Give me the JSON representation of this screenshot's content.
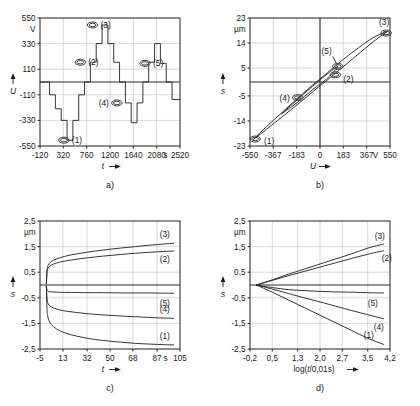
{
  "figure": {
    "panels": [
      {
        "id": "a",
        "label": "a)",
        "yaxis": {
          "unit": "V",
          "title": "U",
          "ticks": [
            "550",
            "330",
            "110",
            "-110",
            "-330",
            "-550"
          ],
          "values": [
            550,
            330,
            110,
            -110,
            -330,
            -550
          ],
          "min": -550,
          "max": 550
        },
        "xaxis": {
          "unit": "s",
          "title": "t",
          "ticks": [
            "-120",
            "320",
            "760",
            "1200",
            "1640",
            "2080",
            "2520"
          ],
          "values": [
            -120,
            320,
            760,
            1200,
            1640,
            2080,
            2520
          ],
          "min": -120,
          "max": 2520
        },
        "markers": [
          {
            "label": "(1)",
            "x": 330,
            "y": -500
          },
          {
            "label": "(2)",
            "x": 640,
            "y": 170
          },
          {
            "label": "(3)",
            "x": 870,
            "y": 490
          },
          {
            "label": "(4)",
            "x": 1330,
            "y": -180
          },
          {
            "label": "(5)",
            "x": 1860,
            "y": 160
          }
        ]
      },
      {
        "id": "b",
        "label": "b)",
        "yaxis": {
          "unit": "µm",
          "title": "s",
          "ticks": [
            "23",
            "14",
            "5",
            "-5",
            "-14",
            "-23"
          ],
          "values": [
            23,
            14,
            5,
            -5,
            -14,
            -23
          ],
          "min": -23,
          "max": 23
        },
        "xaxis": {
          "unit": "V",
          "title": "U",
          "ticks": [
            "-550",
            "-367",
            "-183",
            "0",
            "183",
            "367",
            "550"
          ],
          "values": [
            -550,
            -367,
            -183,
            0,
            183,
            367,
            550
          ],
          "min": -550,
          "max": 550
        },
        "markers": [
          {
            "label": "(1)",
            "x": -510,
            "y": -20.5
          },
          {
            "label": "(2)",
            "x": 120,
            "y": 2.6
          },
          {
            "label": "(3)",
            "x": 520,
            "y": 17.6
          },
          {
            "label": "(4)",
            "x": -175,
            "y": -5.6
          },
          {
            "label": "(5)",
            "x": 140,
            "y": 5.6
          }
        ]
      },
      {
        "id": "c",
        "label": "c)",
        "yaxis": {
          "unit": "µm",
          "title": "s",
          "ticks": [
            "2,5",
            "1,5",
            "0,5",
            "-0,5",
            "-1,5",
            "-2,5"
          ],
          "values": [
            2.5,
            1.5,
            0.5,
            -0.5,
            -1.5,
            -2.5
          ],
          "min": -2.5,
          "max": 2.5
        },
        "xaxis": {
          "unit": "s",
          "title": "t",
          "ticks": [
            "-5",
            "13",
            "32",
            "50",
            "68",
            "87",
            "105"
          ],
          "values": [
            -5,
            13,
            32,
            50,
            68,
            87,
            105
          ],
          "min": -5,
          "max": 105
        },
        "curve_labels": [
          "(3)",
          "(2)",
          "(5)",
          "(4)",
          "(1)"
        ]
      },
      {
        "id": "d",
        "label": "d)",
        "yaxis": {
          "unit": "µm",
          "title": "s",
          "ticks": [
            "2,5",
            "1,5",
            "0,5",
            "-0,5",
            "-1,5",
            "-2,5"
          ],
          "values": [
            2.5,
            1.5,
            0.5,
            -0.5,
            -1.5,
            -2.5
          ],
          "min": -2.5,
          "max": 2.5
        },
        "xaxis": {
          "unit": "",
          "title": "log(t/0,01s)",
          "ticks": [
            "-0,2",
            "0,5",
            "1,3",
            "2,0",
            "2,7",
            "3,5",
            "4,2"
          ],
          "values": [
            -0.2,
            0.5,
            1.3,
            2.0,
            2.7,
            3.5,
            4.2
          ],
          "min": -0.2,
          "max": 4.2
        },
        "curve_labels": [
          "(3)",
          "(2)",
          "(5)",
          "(4)",
          "(1)"
        ]
      }
    ]
  },
  "chart_data": [
    {
      "type": "line",
      "panel": "a",
      "title": "",
      "xlabel": "t",
      "ylabel": "U",
      "xunit": "s",
      "yunit": "V",
      "xlim": [
        -120,
        2520
      ],
      "ylim": [
        -550,
        550
      ],
      "grid": true,
      "series": [
        {
          "name": "drive voltage staircase",
          "step": true,
          "x": [
            -120,
            60,
            60,
            170,
            170,
            280,
            280,
            390,
            390,
            500,
            500,
            610,
            610,
            720,
            720,
            830,
            830,
            940,
            940,
            1050,
            1050,
            1160,
            1160,
            1270,
            1270,
            1380,
            1380,
            1490,
            1490,
            1600,
            1600,
            1710,
            1710,
            1820,
            1820,
            1930,
            1930,
            2040,
            2040,
            2150,
            2150,
            2260,
            2260,
            2370,
            2370,
            2520
          ],
          "y": [
            0,
            0,
            -110,
            -110,
            -230,
            -230,
            -330,
            -330,
            -500,
            -500,
            -330,
            -330,
            -110,
            -110,
            0,
            0,
            170,
            170,
            330,
            330,
            490,
            490,
            330,
            330,
            170,
            170,
            0,
            0,
            -180,
            -180,
            -350,
            -350,
            -180,
            -180,
            0,
            0,
            170,
            170,
            330,
            330,
            160,
            160,
            0,
            0,
            -150,
            -150
          ]
        }
      ]
    },
    {
      "type": "line",
      "panel": "b",
      "title": "",
      "xlabel": "U",
      "ylabel": "s",
      "xunit": "V",
      "yunit": "µm",
      "xlim": [
        -550,
        550
      ],
      "ylim": [
        -23,
        23
      ],
      "grid": true,
      "series": [
        {
          "name": "hysteresis loop outer",
          "closed": true,
          "x": [
            -520,
            -420,
            -300,
            -180,
            -60,
            60,
            180,
            300,
            420,
            520,
            520,
            420,
            300,
            180,
            60,
            -60,
            -180,
            -300,
            -420,
            -520
          ],
          "y": [
            -20.5,
            -16.0,
            -11.0,
            -6.0,
            -1.2,
            3.4,
            8.0,
            12.2,
            16.0,
            17.9,
            17.9,
            14.5,
            10.0,
            5.4,
            0.8,
            -3.6,
            -8.2,
            -12.6,
            -17.0,
            -20.5
          ]
        },
        {
          "name": "hysteresis loop inner",
          "closed": true,
          "x": [
            -300,
            -180,
            -60,
            60,
            140,
            60,
            -60,
            -180,
            -300
          ],
          "y": [
            -11.4,
            -6.4,
            -1.6,
            3.0,
            5.6,
            1.4,
            -2.8,
            -7.4,
            -11.4
          ]
        }
      ]
    },
    {
      "type": "line",
      "panel": "c",
      "title": "",
      "xlabel": "t",
      "ylabel": "s",
      "xunit": "s",
      "yunit": "µm",
      "xlim": [
        -5,
        105
      ],
      "ylim": [
        -2.5,
        2.5
      ],
      "grid": true,
      "series": [
        {
          "name": "(3)",
          "x": [
            0,
            0.5,
            1,
            2,
            4,
            8,
            13,
            20,
            32,
            45,
            58,
            70,
            82,
            92,
            100
          ],
          "y": [
            0.05,
            0.55,
            0.72,
            0.82,
            0.92,
            1.02,
            1.1,
            1.18,
            1.28,
            1.37,
            1.44,
            1.5,
            1.56,
            1.6,
            1.63
          ]
        },
        {
          "name": "(2)",
          "x": [
            0,
            0.5,
            1,
            2,
            4,
            8,
            13,
            20,
            32,
            45,
            58,
            70,
            82,
            92,
            100
          ],
          "y": [
            0.04,
            0.48,
            0.62,
            0.7,
            0.78,
            0.86,
            0.92,
            0.98,
            1.06,
            1.13,
            1.19,
            1.24,
            1.28,
            1.31,
            1.33
          ]
        },
        {
          "name": "(5)",
          "x": [
            0,
            0.5,
            1,
            2,
            4,
            8,
            13,
            20,
            32,
            45,
            58,
            70,
            82,
            92,
            100
          ],
          "y": [
            -0.02,
            -0.18,
            -0.24,
            -0.26,
            -0.27,
            -0.28,
            -0.29,
            -0.29,
            -0.3,
            -0.3,
            -0.31,
            -0.31,
            -0.31,
            -0.32,
            -0.32
          ]
        },
        {
          "name": "(4)",
          "x": [
            0,
            0.5,
            1,
            2,
            4,
            8,
            13,
            20,
            32,
            45,
            58,
            70,
            82,
            92,
            100
          ],
          "y": [
            -0.05,
            -0.52,
            -0.68,
            -0.78,
            -0.86,
            -0.94,
            -1.0,
            -1.05,
            -1.12,
            -1.17,
            -1.21,
            -1.24,
            -1.27,
            -1.29,
            -1.3
          ]
        },
        {
          "name": "(1)",
          "x": [
            0,
            0.5,
            1,
            2,
            4,
            8,
            13,
            20,
            32,
            45,
            58,
            70,
            82,
            92,
            100
          ],
          "y": [
            -0.06,
            -0.95,
            -1.2,
            -1.38,
            -1.55,
            -1.72,
            -1.84,
            -1.95,
            -2.08,
            -2.17,
            -2.23,
            -2.28,
            -2.31,
            -2.33,
            -2.34
          ]
        }
      ]
    },
    {
      "type": "line",
      "panel": "d",
      "title": "",
      "xlabel": "log(t/0,01s)",
      "ylabel": "s",
      "xunit": "",
      "yunit": "µm",
      "xlim": [
        -0.2,
        4.2
      ],
      "ylim": [
        -2.5,
        2.5
      ],
      "grid": true,
      "series": [
        {
          "name": "(3)",
          "x": [
            0,
            0.5,
            1.0,
            1.5,
            2.0,
            2.5,
            3.0,
            3.5,
            4.0
          ],
          "y": [
            0.0,
            0.2,
            0.42,
            0.62,
            0.82,
            1.02,
            1.22,
            1.44,
            1.6
          ]
        },
        {
          "name": "(2)",
          "x": [
            0,
            0.5,
            1.0,
            1.5,
            2.0,
            2.5,
            3.0,
            3.5,
            4.0
          ],
          "y": [
            0.0,
            0.18,
            0.36,
            0.53,
            0.7,
            0.87,
            1.04,
            1.2,
            1.34
          ]
        },
        {
          "name": "(5)",
          "x": [
            0,
            0.5,
            1.0,
            1.5,
            2.0,
            2.5,
            3.0,
            3.5,
            4.0
          ],
          "y": [
            0.0,
            -0.1,
            -0.18,
            -0.22,
            -0.25,
            -0.27,
            -0.28,
            -0.3,
            -0.31
          ]
        },
        {
          "name": "(4)",
          "x": [
            0,
            0.5,
            1.0,
            1.5,
            2.0,
            2.5,
            3.0,
            3.5,
            4.0
          ],
          "y": [
            0.0,
            -0.16,
            -0.33,
            -0.5,
            -0.66,
            -0.83,
            -1.0,
            -1.16,
            -1.32
          ]
        },
        {
          "name": "(1)",
          "x": [
            0,
            0.5,
            1.0,
            1.5,
            2.0,
            2.5,
            3.0,
            3.5,
            4.0
          ],
          "y": [
            0.0,
            -0.28,
            -0.58,
            -0.88,
            -1.18,
            -1.48,
            -1.78,
            -2.08,
            -2.32
          ]
        }
      ]
    }
  ]
}
